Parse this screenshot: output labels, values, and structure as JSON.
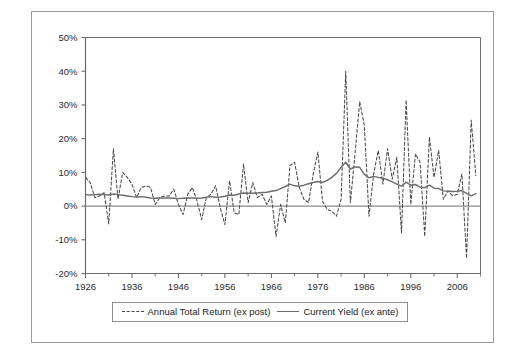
{
  "figure": {
    "background_color": "#ffffff",
    "frame_color": "#9a9a9a"
  },
  "legend": {
    "position": "below-axes",
    "entries": [
      {
        "label": "Annual Total Return (ex post)",
        "style": "dashed",
        "color": "#4a4a4a",
        "icon": "dashed-line-swatch"
      },
      {
        "label": "Current Yield (ex ante)",
        "style": "solid",
        "color": "#6d6d6d",
        "icon": "solid-line-swatch"
      }
    ]
  },
  "axes": {
    "y_tick_labels": [
      "50%",
      "40%",
      "30%",
      "20%",
      "10%",
      "0%",
      "-10%",
      "-20%"
    ],
    "y_tick_values": [
      50,
      40,
      30,
      20,
      10,
      0,
      -10,
      -20
    ],
    "x_tick_labels": [
      "1926",
      "1936",
      "1946",
      "1956",
      "1966",
      "1976",
      "1986",
      "1996",
      "2006"
    ],
    "x_tick_values": [
      1926,
      1936,
      1946,
      1956,
      1966,
      1976,
      1986,
      1996,
      2006
    ],
    "x_minor_tick_values": [
      1931,
      1941,
      1951,
      1961,
      1971,
      1981,
      1991,
      2001,
      2011
    ],
    "zero_line_value": 0
  },
  "chart_data": {
    "type": "line",
    "title": "",
    "subtitle": "",
    "xlabel": "",
    "ylabel": "",
    "xlim": [
      1926,
      2011
    ],
    "ylim": [
      -20,
      50
    ],
    "grid": false,
    "y_unit": "percent",
    "legend_position": "bottom",
    "x": [
      1926,
      1927,
      1928,
      1929,
      1930,
      1931,
      1932,
      1933,
      1934,
      1935,
      1936,
      1937,
      1938,
      1939,
      1940,
      1941,
      1942,
      1943,
      1944,
      1945,
      1946,
      1947,
      1948,
      1949,
      1950,
      1951,
      1952,
      1953,
      1954,
      1955,
      1956,
      1957,
      1958,
      1959,
      1960,
      1961,
      1962,
      1963,
      1964,
      1965,
      1966,
      1967,
      1968,
      1969,
      1970,
      1971,
      1972,
      1973,
      1974,
      1975,
      1976,
      1977,
      1978,
      1979,
      1980,
      1981,
      1982,
      1983,
      1984,
      1985,
      1986,
      1987,
      1988,
      1989,
      1990,
      1991,
      1992,
      1993,
      1994,
      1995,
      1996,
      1997,
      1998,
      1999,
      2000,
      2001,
      2002,
      2003,
      2004,
      2005,
      2006,
      2007,
      2008,
      2009,
      2010
    ],
    "series": [
      {
        "name": "Annual Total Return (ex post)",
        "style": "dashed",
        "color": "#4a4a4a",
        "values": [
          8.5,
          7.0,
          2.5,
          3.0,
          4.0,
          -5.3,
          17.0,
          2.0,
          10.0,
          8.5,
          6.5,
          2.5,
          5.5,
          6.0,
          5.5,
          0.5,
          2.5,
          3.0,
          3.0,
          5.0,
          0.5,
          -2.5,
          3.5,
          5.5,
          1.5,
          -4.0,
          2.5,
          3.5,
          6.0,
          -0.5,
          -5.5,
          7.5,
          -2.0,
          -2.5,
          12.5,
          1.0,
          7.0,
          2.5,
          3.5,
          0.5,
          3.0,
          -9.0,
          0.5,
          -5.0,
          12.0,
          13.0,
          5.5,
          2.0,
          1.0,
          9.5,
          16.0,
          1.5,
          -1.0,
          -1.5,
          -3.0,
          2.0,
          40.0,
          1.0,
          15.5,
          31.0,
          24.0,
          -3.0,
          9.5,
          16.5,
          6.5,
          17.0,
          8.0,
          14.5,
          -8.0,
          31.5,
          0.5,
          15.5,
          13.0,
          -9.0,
          20.5,
          8.5,
          16.5,
          2.0,
          4.5,
          3.0,
          3.5,
          9.5,
          -15.5,
          25.5,
          9.0
        ]
      },
      {
        "name": "Current Yield (ex ante)",
        "style": "solid",
        "color": "#6d6d6d",
        "values": [
          3.4,
          3.3,
          3.4,
          3.5,
          3.4,
          3.3,
          3.6,
          3.4,
          3.2,
          3.0,
          2.8,
          2.7,
          2.8,
          2.6,
          2.4,
          2.3,
          2.4,
          2.4,
          2.4,
          2.3,
          2.2,
          2.3,
          2.4,
          2.4,
          2.3,
          2.4,
          2.6,
          2.8,
          2.6,
          2.7,
          2.9,
          3.3,
          3.2,
          3.6,
          3.9,
          3.8,
          3.8,
          3.9,
          4.0,
          4.1,
          4.4,
          4.6,
          5.2,
          5.8,
          6.5,
          6.0,
          5.9,
          6.2,
          6.6,
          7.0,
          7.3,
          7.0,
          7.6,
          8.5,
          9.7,
          11.5,
          13.0,
          11.0,
          11.6,
          11.5,
          9.4,
          8.4,
          8.8,
          8.5,
          8.3,
          7.8,
          7.2,
          6.5,
          5.9,
          7.1,
          6.2,
          6.4,
          5.6,
          5.5,
          6.2,
          5.3,
          5.2,
          4.5,
          4.4,
          4.3,
          4.4,
          4.6,
          3.8,
          3.0,
          3.7
        ]
      }
    ],
    "annotations": []
  }
}
